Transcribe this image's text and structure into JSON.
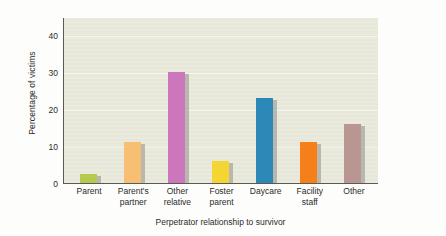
{
  "chart_data": {
    "type": "bar",
    "title": "",
    "xlabel": "Perpetrator relationship to survivor",
    "ylabel": "Percentage of victims",
    "categories": [
      "Parent",
      "Parent's partner",
      "Other relative",
      "Foster parent",
      "Daycare",
      "Facility staff",
      "Other"
    ],
    "category_lines": [
      [
        "Parent",
        ""
      ],
      [
        "Parent's",
        "partner"
      ],
      [
        "Other",
        "relative"
      ],
      [
        "Foster",
        "parent"
      ],
      [
        "Daycare",
        ""
      ],
      [
        "Facility",
        "staff"
      ],
      [
        "Other",
        ""
      ]
    ],
    "values": [
      2.5,
      11,
      30,
      6,
      23,
      11,
      16
    ],
    "bar_colors": [
      "#b6ca4f",
      "#f8bf74",
      "#cb76bd",
      "#f5d531",
      "#2c88b6",
      "#f57f18",
      "#b99691"
    ],
    "ylim": [
      0,
      45
    ],
    "yticks": [
      0,
      10,
      20,
      30,
      40
    ],
    "ytick_labels": [
      "0",
      "10",
      "20",
      "30",
      "40"
    ],
    "grid": true,
    "legend": "none",
    "plot_background": "#e9e9dc",
    "gridline_color": "#f6f6ee",
    "axis_color": "#5a5a55",
    "shadow_color": "#9a9a93"
  }
}
